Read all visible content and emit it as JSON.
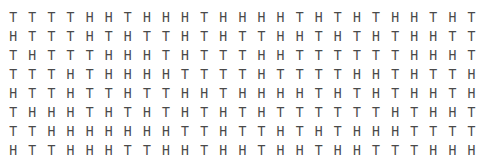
{
  "grid": {
    "rows": [
      [
        "T",
        "T",
        "T",
        "T",
        "H",
        "H",
        "T",
        "H",
        "H",
        "H",
        "T",
        "H",
        "H",
        "H",
        "H",
        "T",
        "H",
        "T",
        "H",
        "T",
        "H",
        "H",
        "T",
        "H",
        "T"
      ],
      [
        "H",
        "T",
        "T",
        "T",
        "H",
        "T",
        "H",
        "T",
        "T",
        "H",
        "T",
        "H",
        "T",
        "T",
        "H",
        "H",
        "T",
        "H",
        "T",
        "H",
        "T",
        "H",
        "H",
        "T",
        "T"
      ],
      [
        "T",
        "H",
        "T",
        "T",
        "T",
        "H",
        "H",
        "H",
        "T",
        "H",
        "T",
        "T",
        "T",
        "H",
        "H",
        "T",
        "T",
        "T",
        "T",
        "T",
        "T",
        "H",
        "H",
        "H",
        "T"
      ],
      [
        "T",
        "T",
        "T",
        "H",
        "T",
        "H",
        "H",
        "H",
        "H",
        "T",
        "T",
        "T",
        "T",
        "H",
        "T",
        "T",
        "T",
        "T",
        "H",
        "H",
        "T",
        "H",
        "T",
        "T",
        "H"
      ],
      [
        "H",
        "T",
        "T",
        "H",
        "T",
        "T",
        "H",
        "T",
        "T",
        "H",
        "H",
        "T",
        "H",
        "H",
        "H",
        "H",
        "T",
        "H",
        "T",
        "H",
        "T",
        "H",
        "H",
        "T",
        "H"
      ],
      [
        "T",
        "H",
        "H",
        "H",
        "T",
        "H",
        "T",
        "H",
        "T",
        "H",
        "T",
        "H",
        "T",
        "H",
        "T",
        "T",
        "T",
        "T",
        "T",
        "T",
        "H",
        "T",
        "H",
        "H",
        "T"
      ],
      [
        "T",
        "T",
        "H",
        "H",
        "H",
        "H",
        "H",
        "H",
        "H",
        "T",
        "T",
        "H",
        "T",
        "T",
        "H",
        "T",
        "H",
        "T",
        "H",
        "H",
        "H",
        "T",
        "T",
        "T",
        "T"
      ],
      [
        "H",
        "T",
        "T",
        "H",
        "H",
        "H",
        "T",
        "T",
        "H",
        "H",
        "T",
        "H",
        "H",
        "T",
        "H",
        "H",
        "T",
        "H",
        "H",
        "T",
        "T",
        "T",
        "H",
        "H",
        "H"
      ]
    ]
  }
}
